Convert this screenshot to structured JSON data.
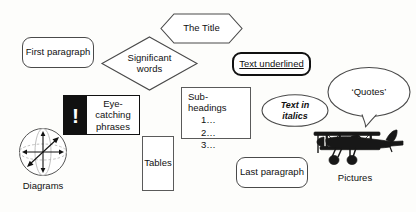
{
  "diagram": {
    "background_color": "#fdfdfb",
    "stroke_color": "#4a4a4a",
    "accent_black": "#111111",
    "nodes": {
      "first_paragraph": {
        "label": "First paragraph",
        "shape": "rounded-rectangle"
      },
      "the_title": {
        "label": "The Title",
        "shape": "hexagon"
      },
      "significant_words": {
        "label_line1": "Significant",
        "label_line2": "words",
        "shape": "diamond"
      },
      "text_underlined": {
        "label": "Text underlined",
        "shape": "rounded-rectangle-bold"
      },
      "eye_catching": {
        "icon": "exclamation-mark",
        "icon_glyph": "!",
        "label_line1": "Eye-",
        "label_line2": "catching",
        "label_line3": "phrases",
        "shape": "rectangle-split"
      },
      "sub_headings": {
        "title": "Sub-headings",
        "items": [
          "1…",
          "2…",
          "3…"
        ],
        "shape": "rectangle"
      },
      "text_in_italics": {
        "label_line1": "Text in",
        "label_line2": "italics",
        "shape": "ellipse"
      },
      "quotes": {
        "label": "‘Quotes’",
        "shape": "speech-balloon"
      },
      "tables": {
        "label": "Tables",
        "shape": "rectangle"
      },
      "last_paragraph": {
        "label": "Last paragraph",
        "shape": "rounded-rectangle"
      },
      "diagrams": {
        "caption": "Diagrams",
        "figure": "sphere-with-axes"
      },
      "pictures": {
        "caption": "Pictures",
        "figure": "biplane-silhouette"
      }
    }
  }
}
